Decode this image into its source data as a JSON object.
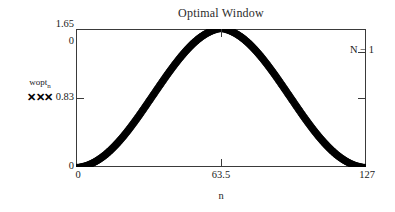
{
  "chart_data": {
    "type": "scatter",
    "title": "Optimal Window",
    "xlabel": "n",
    "ylabel": "",
    "xlim": [
      0,
      127
    ],
    "ylim": [
      0,
      1.65
    ],
    "grid": false,
    "legend_position": "left-outside",
    "marker": "x",
    "series": [
      {
        "name": "wopt",
        "name_subscript": "n",
        "marker_sample": "✕✕✕",
        "n_points": 128,
        "description": "Raised-cosine (Hann-like) optimal window, peak 1.65 at n = 63.5, zero at n = 0 and n = 127",
        "x": [
          0,
          1,
          2,
          3,
          4,
          5,
          6,
          7,
          8,
          9,
          10,
          11,
          12,
          13,
          14,
          15,
          16,
          17,
          18,
          19,
          20,
          21,
          22,
          23,
          24,
          25,
          26,
          27,
          28,
          29,
          30,
          31,
          32,
          33,
          34,
          35,
          36,
          37,
          38,
          39,
          40,
          41,
          42,
          43,
          44,
          45,
          46,
          47,
          48,
          49,
          50,
          51,
          52,
          53,
          54,
          55,
          56,
          57,
          58,
          59,
          60,
          61,
          62,
          63,
          64,
          65,
          66,
          67,
          68,
          69,
          70,
          71,
          72,
          73,
          74,
          75,
          76,
          77,
          78,
          79,
          80,
          81,
          82,
          83,
          84,
          85,
          86,
          87,
          88,
          89,
          90,
          91,
          92,
          93,
          94,
          95,
          96,
          97,
          98,
          99,
          100,
          101,
          102,
          103,
          104,
          105,
          106,
          107,
          108,
          109,
          110,
          111,
          112,
          113,
          114,
          115,
          116,
          117,
          118,
          119,
          120,
          121,
          122,
          123,
          124,
          125,
          126,
          127
        ],
        "y": [
          0.0,
          0.001,
          0.004,
          0.009,
          0.016,
          0.025,
          0.036,
          0.049,
          0.064,
          0.081,
          0.1,
          0.121,
          0.143,
          0.167,
          0.193,
          0.221,
          0.25,
          0.281,
          0.313,
          0.347,
          0.382,
          0.418,
          0.456,
          0.494,
          0.534,
          0.575,
          0.616,
          0.658,
          0.701,
          0.745,
          0.789,
          0.833,
          0.878,
          0.922,
          0.967,
          1.012,
          1.056,
          1.1,
          1.144,
          1.188,
          1.231,
          1.273,
          1.314,
          1.355,
          1.394,
          1.433,
          1.47,
          1.506,
          1.541,
          1.574,
          1.606,
          1.636,
          1.664,
          1.69,
          1.715,
          1.737,
          1.758,
          1.776,
          1.792,
          1.806,
          1.818,
          1.827,
          1.834,
          1.838,
          1.838,
          1.834,
          1.827,
          1.818,
          1.806,
          1.792,
          1.776,
          1.758,
          1.737,
          1.715,
          1.69,
          1.664,
          1.636,
          1.606,
          1.574,
          1.541,
          1.506,
          1.47,
          1.433,
          1.394,
          1.355,
          1.314,
          1.273,
          1.231,
          1.188,
          1.144,
          1.1,
          1.056,
          1.012,
          0.967,
          0.922,
          0.878,
          0.833,
          0.789,
          0.745,
          0.701,
          0.658,
          0.616,
          0.575,
          0.534,
          0.494,
          0.456,
          0.418,
          0.382,
          0.347,
          0.313,
          0.281,
          0.25,
          0.221,
          0.193,
          0.167,
          0.143,
          0.121,
          0.1,
          0.081,
          0.064,
          0.049,
          0.036,
          0.025,
          0.016,
          0.009,
          0.004,
          0.001,
          0.0
        ]
      }
    ],
    "y_ticks": [
      "1.65",
      "0.83",
      "0"
    ],
    "x_ticks": [
      "0",
      "63.5",
      "127"
    ],
    "annotations": [
      {
        "text": "N − 1",
        "position": "right-axis"
      },
      {
        "text": "0",
        "position": "top-left-inner"
      }
    ]
  },
  "axes": {
    "y_top_label": "1.65",
    "y_top_inner_label": "0",
    "y_mid_label": "0.83",
    "y_bottom_label": "0",
    "x_left_label": "0",
    "x_mid_label": "63.5",
    "x_right_label": "127",
    "x_title": "n",
    "right_label": "N − 1"
  },
  "legend": {
    "series_name": "wopt",
    "series_subscript": "n",
    "marker_glyphs": "✕✕✕"
  },
  "colors": {
    "axis": "#3a3a3a",
    "curve": "#000000",
    "text": "#1a1a1a",
    "title": "#2b2b2b",
    "background": "#ffffff"
  }
}
